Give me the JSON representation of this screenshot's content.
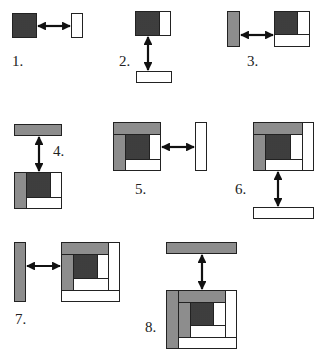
{
  "colors": {
    "dark": "#6e6e6e",
    "light": "#b9b9b9",
    "white": "#ffffff",
    "line": "#222222"
  },
  "steps": [
    {
      "label": "1.",
      "label_pos": [
        12,
        54
      ]
    },
    {
      "label": "2.",
      "label_pos": [
        119,
        54
      ]
    },
    {
      "label": "3.",
      "label_pos": [
        247,
        54
      ]
    },
    {
      "label": "4.",
      "label_pos": [
        53,
        144
      ]
    },
    {
      "label": "5.",
      "label_pos": [
        135,
        182
      ]
    },
    {
      "label": "6.",
      "label_pos": [
        235,
        182
      ]
    },
    {
      "label": "7.",
      "label_pos": [
        15,
        312
      ]
    },
    {
      "label": "8.",
      "label_pos": [
        145,
        320
      ]
    }
  ],
  "pieces": [
    {
      "step": 1,
      "shade": "dark",
      "x": 12,
      "y": 13,
      "w": 25,
      "h": 25
    },
    {
      "step": 1,
      "shade": "white",
      "x": 71,
      "y": 13,
      "w": 12,
      "h": 25
    },
    {
      "step": 2,
      "shade": "dark",
      "x": 135,
      "y": 11,
      "w": 25,
      "h": 25
    },
    {
      "step": 2,
      "shade": "white",
      "x": 159,
      "y": 11,
      "w": 12,
      "h": 25
    },
    {
      "step": 2,
      "shade": "white",
      "x": 136,
      "y": 71,
      "w": 36,
      "h": 12
    },
    {
      "step": 3,
      "shade": "light",
      "x": 227,
      "y": 11,
      "w": 13,
      "h": 36
    },
    {
      "step": 3,
      "shade": "dark",
      "x": 274,
      "y": 11,
      "w": 24,
      "h": 24
    },
    {
      "step": 3,
      "shade": "white",
      "x": 297,
      "y": 11,
      "w": 13,
      "h": 24
    },
    {
      "step": 3,
      "shade": "white",
      "x": 274,
      "y": 34,
      "w": 36,
      "h": 13
    },
    {
      "step": 4,
      "shade": "light",
      "x": 14,
      "y": 124,
      "w": 48,
      "h": 12
    },
    {
      "step": 4,
      "shade": "light",
      "x": 14,
      "y": 172,
      "w": 13,
      "h": 37
    },
    {
      "step": 4,
      "shade": "dark",
      "x": 26,
      "y": 172,
      "w": 25,
      "h": 26
    },
    {
      "step": 4,
      "shade": "white",
      "x": 50,
      "y": 172,
      "w": 12,
      "h": 26
    },
    {
      "step": 4,
      "shade": "white",
      "x": 26,
      "y": 197,
      "w": 36,
      "h": 12
    },
    {
      "step": 5,
      "shade": "light",
      "x": 113,
      "y": 122,
      "w": 48,
      "h": 13
    },
    {
      "step": 5,
      "shade": "light",
      "x": 113,
      "y": 134,
      "w": 13,
      "h": 37
    },
    {
      "step": 5,
      "shade": "dark",
      "x": 125,
      "y": 134,
      "w": 25,
      "h": 26
    },
    {
      "step": 5,
      "shade": "white",
      "x": 149,
      "y": 134,
      "w": 12,
      "h": 26
    },
    {
      "step": 5,
      "shade": "white",
      "x": 125,
      "y": 159,
      "w": 36,
      "h": 12
    },
    {
      "step": 5,
      "shade": "white",
      "x": 195,
      "y": 122,
      "w": 12,
      "h": 49
    },
    {
      "step": 6,
      "shade": "light",
      "x": 253,
      "y": 122,
      "w": 50,
      "h": 13
    },
    {
      "step": 6,
      "shade": "white",
      "x": 302,
      "y": 122,
      "w": 12,
      "h": 49
    },
    {
      "step": 6,
      "shade": "light",
      "x": 253,
      "y": 134,
      "w": 13,
      "h": 37
    },
    {
      "step": 6,
      "shade": "dark",
      "x": 265,
      "y": 134,
      "w": 26,
      "h": 26
    },
    {
      "step": 6,
      "shade": "white",
      "x": 290,
      "y": 134,
      "w": 13,
      "h": 26
    },
    {
      "step": 6,
      "shade": "white",
      "x": 265,
      "y": 159,
      "w": 38,
      "h": 12
    },
    {
      "step": 6,
      "shade": "white",
      "x": 253,
      "y": 207,
      "w": 61,
      "h": 12
    },
    {
      "step": 7,
      "shade": "light",
      "x": 14,
      "y": 242,
      "w": 12,
      "h": 60
    },
    {
      "step": 7,
      "shade": "light",
      "x": 61,
      "y": 242,
      "w": 48,
      "h": 13
    },
    {
      "step": 7,
      "shade": "white",
      "x": 108,
      "y": 242,
      "w": 12,
      "h": 49
    },
    {
      "step": 7,
      "shade": "light",
      "x": 61,
      "y": 254,
      "w": 13,
      "h": 37
    },
    {
      "step": 7,
      "shade": "dark",
      "x": 73,
      "y": 254,
      "w": 25,
      "h": 25
    },
    {
      "step": 7,
      "shade": "white",
      "x": 97,
      "y": 254,
      "w": 12,
      "h": 25
    },
    {
      "step": 7,
      "shade": "white",
      "x": 73,
      "y": 278,
      "w": 36,
      "h": 13
    },
    {
      "step": 7,
      "shade": "white",
      "x": 61,
      "y": 290,
      "w": 59,
      "h": 12
    },
    {
      "step": 8,
      "shade": "light",
      "x": 166,
      "y": 242,
      "w": 71,
      "h": 12
    },
    {
      "step": 8,
      "shade": "light",
      "x": 166,
      "y": 290,
      "w": 13,
      "h": 59
    },
    {
      "step": 8,
      "shade": "light",
      "x": 178,
      "y": 290,
      "w": 48,
      "h": 13
    },
    {
      "step": 8,
      "shade": "white",
      "x": 225,
      "y": 290,
      "w": 12,
      "h": 48
    },
    {
      "step": 8,
      "shade": "light",
      "x": 178,
      "y": 302,
      "w": 13,
      "h": 36
    },
    {
      "step": 8,
      "shade": "dark",
      "x": 190,
      "y": 302,
      "w": 24,
      "h": 24
    },
    {
      "step": 8,
      "shade": "white",
      "x": 213,
      "y": 302,
      "w": 13,
      "h": 24
    },
    {
      "step": 8,
      "shade": "white",
      "x": 190,
      "y": 325,
      "w": 36,
      "h": 13
    },
    {
      "step": 8,
      "shade": "white",
      "x": 178,
      "y": 337,
      "w": 59,
      "h": 12
    }
  ],
  "arrows": [
    {
      "step": 1,
      "x1": 38,
      "y1": 26,
      "x2": 70,
      "y2": 26
    },
    {
      "step": 2,
      "x1": 148,
      "y1": 37,
      "x2": 148,
      "y2": 70
    },
    {
      "step": 3,
      "x1": 241,
      "y1": 35,
      "x2": 273,
      "y2": 35
    },
    {
      "step": 4,
      "x1": 39,
      "y1": 137,
      "x2": 39,
      "y2": 171
    },
    {
      "step": 5,
      "x1": 162,
      "y1": 147,
      "x2": 194,
      "y2": 147
    },
    {
      "step": 6,
      "x1": 278,
      "y1": 172,
      "x2": 278,
      "y2": 206
    },
    {
      "step": 7,
      "x1": 27,
      "y1": 266,
      "x2": 60,
      "y2": 266
    },
    {
      "step": 8,
      "x1": 202,
      "y1": 255,
      "x2": 202,
      "y2": 289
    }
  ]
}
